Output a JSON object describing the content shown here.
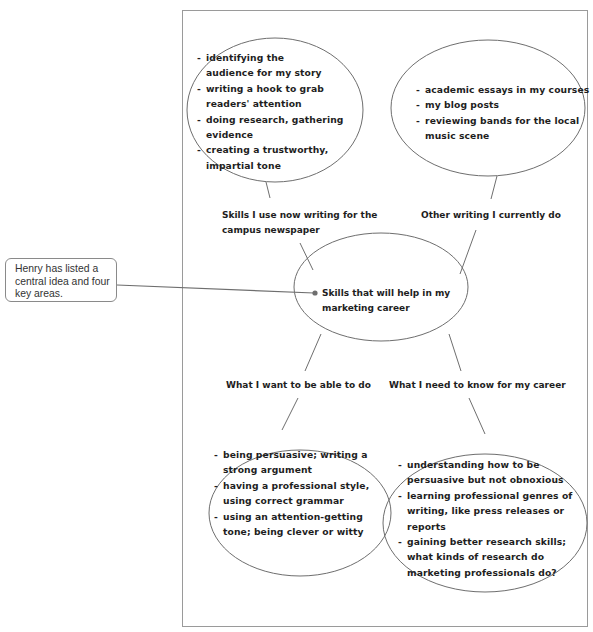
{
  "callout": {
    "text_lines": [
      "Henry has listed a",
      "central idea and four",
      "key areas."
    ]
  },
  "central": {
    "line1": "Skills that will help in my",
    "line2": "marketing career"
  },
  "branches": {
    "top_left": {
      "label_line1": "Skills I use now writing for the",
      "label_line2": "campus newspaper",
      "items": [
        {
          "l1": "identifying the",
          "l2": "audience for my story"
        },
        {
          "l1": "writing a hook to grab",
          "l2": "readers' attention"
        },
        {
          "l1": "doing research, gathering",
          "l2": "evidence"
        },
        {
          "l1": "creating a trustworthy,",
          "l2": "impartial tone"
        }
      ]
    },
    "top_right": {
      "label": "Other writing I currently do",
      "items": [
        {
          "l1": "academic essays in my courses",
          "l2": ""
        },
        {
          "l1": "my blog posts",
          "l2": ""
        },
        {
          "l1": "reviewing bands for the local",
          "l2": "music scene"
        }
      ]
    },
    "bottom_left": {
      "label": "What I want to be able to do",
      "items": [
        {
          "l1": "being persuasive; writing a",
          "l2": "strong argument"
        },
        {
          "l1": "having a professional style,",
          "l2": "using correct grammar"
        },
        {
          "l1": "using an attention-getting",
          "l2": "tone; being clever or witty"
        }
      ]
    },
    "bottom_right": {
      "label": "What I need to know for my career",
      "items": [
        {
          "l1": "understanding how to be",
          "l2": "persuasive but not obnoxious"
        },
        {
          "l1": "learning professional genres of",
          "l2": "writing, like press releases or reports"
        },
        {
          "l1": "gaining better research skills;",
          "l2": "what kinds of research do",
          "l3": "marketing professionals do?"
        }
      ]
    }
  },
  "dash": "-",
  "colors": {
    "line": "#6e6e6e",
    "text": "#1e1e1e",
    "frame": "#9a9a9a",
    "callout_border": "#8a8a8a"
  }
}
